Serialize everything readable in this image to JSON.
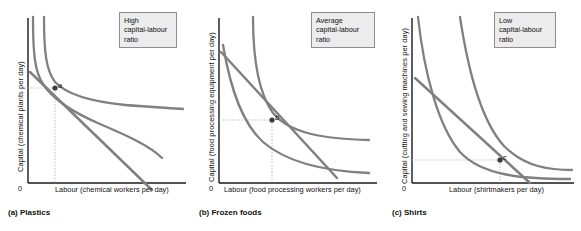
{
  "figure": {
    "kind": "isoquant-isocost-panels",
    "panel_count": 3,
    "curve_color": "#808080",
    "axis_color": "#1a1a1a",
    "guide_color": "#b0b0b0",
    "callout_bg": "#ececec",
    "callout_border": "#8e8e8e"
  },
  "panels": [
    {
      "id": "a",
      "caption": "(a) Plastics",
      "callout": "High capital-labour ratio",
      "callout_lines": [
        "High",
        "capital-labour",
        "ratio"
      ],
      "ylabel": "Capital (chemical plants per day)",
      "xlabel": "Labour (chemical workers per day)",
      "origin": "0",
      "point_label": "a",
      "point": {
        "x": 55,
        "y": 88
      },
      "description": "Cost-minimizing input mix uses much capital and little labour; tangency occurs high on the isoquant near the vertical axis."
    },
    {
      "id": "b",
      "caption": "(b) Frozen foods",
      "callout": "Average capital-labour ratio",
      "callout_lines": [
        "Average",
        "capital-labour",
        "ratio"
      ],
      "ylabel": "Capital (food processing equipment per day)",
      "xlabel": "Labour (food processing workers per day)",
      "origin": "0",
      "point_label": "b",
      "point": {
        "x": 81,
        "y": 120
      },
      "description": "Cost-minimizing input mix balances capital and labour; tangency occurs near the middle of the isoquant."
    },
    {
      "id": "c",
      "caption": "(c) Shirts",
      "callout": "Low capital-labour ratio",
      "callout_lines": [
        "Low",
        "capital-labour",
        "ratio"
      ],
      "ylabel": "Capital (cutting and sewing machines per day)",
      "xlabel": "Labour (shirtmakers per day)",
      "origin": "0",
      "point_label": "c",
      "point": {
        "x": 116,
        "y": 160
      },
      "description": "Cost-minimizing input mix uses much labour and little capital; tangency occurs low on the isoquant far from the vertical axis."
    }
  ]
}
